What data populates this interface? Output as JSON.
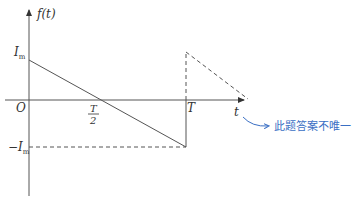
{
  "diagram": {
    "title": "",
    "y_axis_label": "f(t)",
    "x_axis_label": "t",
    "origin_label": "O",
    "tick_labels": {
      "pos_amplitude": "I",
      "pos_amplitude_sub": "m",
      "neg_amplitude_prefix": "−",
      "neg_amplitude": "I",
      "neg_amplitude_sub": "m",
      "half_period_num": "T",
      "half_period_den": "2",
      "period": "T"
    },
    "segments": [
      {
        "name": "solid ramp",
        "from": {
          "t": 0,
          "f": "Im"
        },
        "to": {
          "t": "T",
          "f": "-Im"
        },
        "style": "solid"
      },
      {
        "name": "vertical jump",
        "from": {
          "t": "T",
          "f": "-Im"
        },
        "to": {
          "t": "T",
          "f": "Im"
        },
        "style": "solid below axis, dashed above"
      },
      {
        "name": "next period ramp",
        "from": {
          "t": "T",
          "f": "Im"
        },
        "to": {
          "t": "≈1.33T",
          "f": 0
        },
        "style": "dashed"
      },
      {
        "name": "-Im reference",
        "from": {
          "t": 0,
          "f": "-Im"
        },
        "to": {
          "t": "T",
          "f": "-Im"
        },
        "style": "dashed"
      }
    ],
    "colors": {
      "axis": "#555555",
      "line": "#555555",
      "annotation": "#3a6fc4"
    }
  },
  "annotation": {
    "text": "此题答案不唯一",
    "arrow": "curved-arrow"
  }
}
